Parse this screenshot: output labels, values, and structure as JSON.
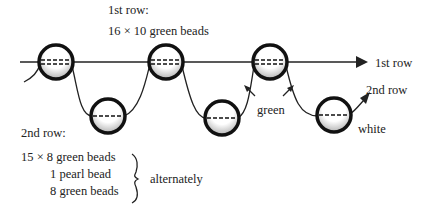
{
  "labels": {
    "row1_heading": "1st row:",
    "row1_spec": "16 × 10 green beads",
    "row1_arrow": "1st row",
    "row2_arrow": "2nd row",
    "green": "green",
    "white": "white",
    "row2_heading": "2nd row:",
    "row2_line1": "15 × 8 green beads",
    "row2_line2": "1 pearl bead",
    "row2_line3": "8 green beads",
    "alternately": "alternately"
  },
  "beads": [
    {
      "row": 1,
      "x": 56,
      "y": 62
    },
    {
      "row": 2,
      "x": 108,
      "y": 116
    },
    {
      "row": 1,
      "x": 166,
      "y": 62
    },
    {
      "row": 2,
      "x": 222,
      "y": 118
    },
    {
      "row": 1,
      "x": 270,
      "y": 62
    },
    {
      "row": 2,
      "x": 334,
      "y": 115
    }
  ]
}
